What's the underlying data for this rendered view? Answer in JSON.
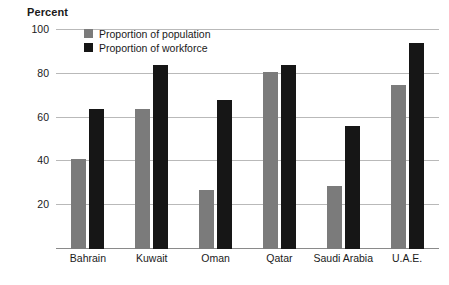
{
  "chart_data": {
    "type": "bar",
    "title": "",
    "ylabel": "Percent",
    "xlabel": "",
    "ylim": [
      0,
      100
    ],
    "yticks": [
      20,
      40,
      60,
      80,
      100
    ],
    "grid": true,
    "legend_position": "top-left",
    "categories": [
      "Bahrain",
      "Kuwait",
      "Oman",
      "Qatar",
      "Saudi Arabia",
      "U.A.E."
    ],
    "series": [
      {
        "name": "Proportion of population",
        "color": "#7b7b7b",
        "values": [
          41,
          64,
          27,
          81,
          29,
          75
        ]
      },
      {
        "name": "Proportion of workforce",
        "color": "#161616",
        "values": [
          64,
          84,
          68,
          84,
          56,
          94
        ]
      }
    ]
  }
}
